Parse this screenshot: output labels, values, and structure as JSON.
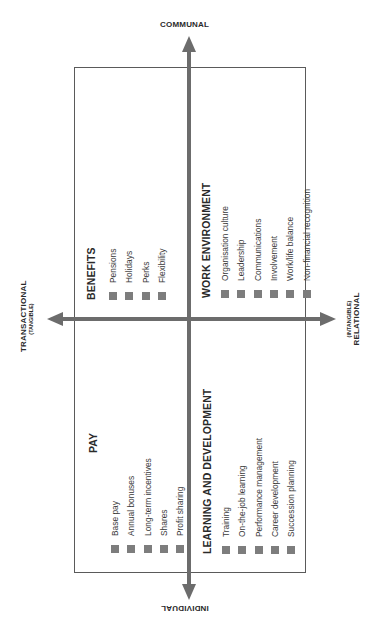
{
  "axes": {
    "top": {
      "label": "COMMUNAL"
    },
    "bottom": {
      "label": "INDIVIDUAL"
    },
    "left": {
      "label": "TRANSACTIONAL",
      "sublabel": "(TANGIBLE)"
    },
    "right": {
      "label": "RELATIONAL",
      "sublabel": "(INTANGIBLE)"
    }
  },
  "quadrants": {
    "top_left": {
      "title": "BENEFITS",
      "items": [
        "Pensions",
        "Holidays",
        "Perks",
        "Flexibility"
      ]
    },
    "top_right": {
      "title": "WORK ENVIRONMENT",
      "items": [
        "Organisation culture",
        "Leadership",
        "Communications",
        "Involvement",
        "Work/life balance",
        "Non-financial recognition"
      ]
    },
    "bottom_left": {
      "title": "PAY",
      "items": [
        "Base pay",
        "Annual bonuses",
        "Long-term incentives",
        "Shares",
        "Profit sharing"
      ]
    },
    "bottom_right": {
      "title": "LEARNING AND DEVELOPMENT",
      "items": [
        "Training",
        "On-the-job learning",
        "Performance management",
        "Career development",
        "Succession planning"
      ]
    }
  },
  "colors": {
    "axis": "#6c6c6c",
    "border": "#5a5a5a",
    "bullet": "#7d7d7d",
    "text": "#2a2a2a"
  }
}
